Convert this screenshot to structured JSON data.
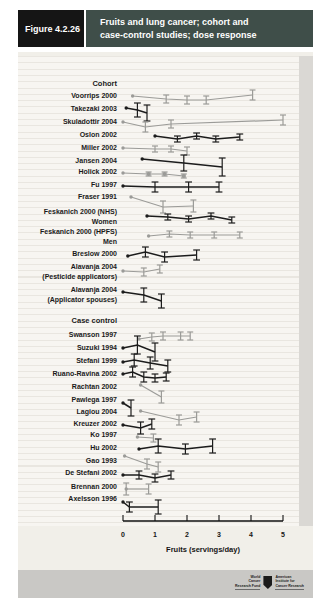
{
  "header": {
    "figure_label": "Figure 4.2.26",
    "title_line1": "Fruits and lung cancer; cohort and",
    "title_line2": "case-control studies; dose response"
  },
  "chart_data": {
    "type": "line",
    "title": "Fruits and lung cancer; cohort and case-control studies; dose response",
    "xlabel": "Fruits (servings/day)",
    "x_ticks": [
      0,
      1,
      2,
      3,
      4,
      5
    ],
    "xlim": [
      0,
      5
    ],
    "y_encoding": "each study is a dose-response polyline in its own row; dy = vertical pixel offset (relative risk, unlabeled scale); eb = confidence-interval half-height in px",
    "axis": {
      "x0": 123,
      "px_per_unit": 32,
      "axis_y": 521,
      "tick_len": 6
    },
    "colors": {
      "black": "#1c1c1c",
      "gray": "#9b9b98"
    },
    "groups": [
      {
        "label": "Cohort",
        "label_y": 84,
        "studies": [
          {
            "name": "Voorrips 2000",
            "label_y": 96,
            "line_y": 96,
            "color": "gray",
            "points": [
              {
                "x": 0.3,
                "dy": 0
              },
              {
                "x": 1.35,
                "dy": 3,
                "eb": 4
              },
              {
                "x": 2.0,
                "dy": 4,
                "eb": 4
              },
              {
                "x": 2.6,
                "dy": 4,
                "eb": 4
              },
              {
                "x": 4.05,
                "dy": -1,
                "eb": 5
              }
            ]
          },
          {
            "name": "Takezaki 2003",
            "label_y": 109,
            "line_y": 110,
            "color": "black",
            "points": [
              {
                "x": 0.1,
                "dy": -2
              },
              {
                "x": 0.45,
                "dy": 0,
                "eb": 7
              },
              {
                "x": 0.75,
                "dy": 3,
                "eb": 8
              }
            ]
          },
          {
            "name": "Skuladottir 2004",
            "label_y": 122,
            "line_y": 122,
            "color": "gray",
            "points": [
              {
                "x": 0.0,
                "dy": 0
              },
              {
                "x": 0.7,
                "dy": 5,
                "eb": 5
              },
              {
                "x": 1.5,
                "dy": 2,
                "eb": 4
              },
              {
                "x": 5.0,
                "dy": -2,
                "eb": 5
              }
            ]
          },
          {
            "name": "Oslon 2002",
            "label_y": 135,
            "line_y": 136,
            "color": "black",
            "points": [
              {
                "x": 1.0,
                "dy": 0
              },
              {
                "x": 1.7,
                "dy": 3,
                "eb": 3
              },
              {
                "x": 2.3,
                "dy": 0,
                "eb": 3
              },
              {
                "x": 2.9,
                "dy": 3,
                "eb": 3
              },
              {
                "x": 3.65,
                "dy": 1,
                "eb": 3
              }
            ]
          },
          {
            "name": "Miller 2002",
            "label_y": 148,
            "line_y": 148,
            "color": "gray",
            "points": [
              {
                "x": 0.0,
                "dy": 0
              },
              {
                "x": 1.0,
                "dy": 1,
                "eb": 3
              },
              {
                "x": 1.5,
                "dy": 1,
                "eb": 3
              },
              {
                "x": 2.0,
                "dy": 3,
                "eb": 4
              }
            ]
          },
          {
            "name": "Jansen 2004",
            "label_y": 161,
            "line_y": 162,
            "color": "black",
            "points": [
              {
                "x": 0.6,
                "dy": -3
              },
              {
                "x": 1.9,
                "dy": 1,
                "eb": 8
              },
              {
                "x": 3.1,
                "dy": 5,
                "eb": 9
              }
            ]
          },
          {
            "name": "Holick 2002",
            "label_y": 172,
            "line_y": 173,
            "color": "gray",
            "points": [
              {
                "x": 0.0,
                "dy": 0
              },
              {
                "x": 0.8,
                "dy": 1,
                "eb": 2,
                "sq": true
              },
              {
                "x": 1.3,
                "dy": 1,
                "eb": 2,
                "sq": true
              },
              {
                "x": 1.9,
                "dy": 3,
                "eb": 2,
                "sq": true
              }
            ]
          },
          {
            "name": "Fu 1997",
            "label_y": 185,
            "line_y": 186,
            "color": "black",
            "points": [
              {
                "x": 0.0,
                "dy": 0
              },
              {
                "x": 1.0,
                "dy": 1,
                "eb": 5
              },
              {
                "x": 2.05,
                "dy": 1,
                "eb": 5
              },
              {
                "x": 3.0,
                "dy": 1,
                "eb": 5
              }
            ]
          },
          {
            "name": "Fraser 1991",
            "label_y": 197,
            "line_y": 202,
            "color": "gray",
            "points": [
              {
                "x": 0.25,
                "dy": -5
              },
              {
                "x": 1.25,
                "dy": 5,
                "eb": 6
              },
              {
                "x": 2.2,
                "dy": 4,
                "eb": 6
              }
            ]
          },
          {
            "name": "Feskanich 2000 (NHS) Women",
            "label_lines": [
              "Feskanich 2000 (NHS)",
              "Women"
            ],
            "label_y": 217,
            "line_y": 216,
            "color": "black",
            "points": [
              {
                "x": 0.75,
                "dy": 0
              },
              {
                "x": 1.4,
                "dy": 1,
                "eb": 3
              },
              {
                "x": 2.05,
                "dy": 3,
                "eb": 3
              },
              {
                "x": 2.75,
                "dy": 0,
                "eb": 3
              },
              {
                "x": 3.4,
                "dy": 4,
                "eb": 3
              }
            ]
          },
          {
            "name": "Feskanich 2000 (HPFS) Men",
            "label_lines": [
              "Feskanich 2000 (HPFS)",
              "Men"
            ],
            "label_y": 237,
            "line_y": 236,
            "color": "gray",
            "points": [
              {
                "x": 0.8,
                "dy": 0
              },
              {
                "x": 1.45,
                "dy": -2,
                "eb": 3
              },
              {
                "x": 2.1,
                "dy": -1,
                "eb": 3
              },
              {
                "x": 2.85,
                "dy": -1,
                "eb": 3
              },
              {
                "x": 3.65,
                "dy": -1,
                "eb": 3
              }
            ]
          },
          {
            "name": "Breslow 2000",
            "label_y": 254,
            "line_y": 255,
            "color": "black",
            "points": [
              {
                "x": 0.15,
                "dy": 1
              },
              {
                "x": 0.7,
                "dy": -3,
                "eb": 5
              },
              {
                "x": 1.3,
                "dy": 2,
                "eb": 5
              },
              {
                "x": 2.3,
                "dy": 0,
                "eb": 5
              }
            ]
          },
          {
            "name": "Alavanja 2004 (Pesticide applicators)",
            "label_lines": [
              "Alavanja 2004",
              "(Pesticide applicators)"
            ],
            "label_y": 272,
            "line_y": 272,
            "color": "gray",
            "points": [
              {
                "x": 0.0,
                "dy": -1
              },
              {
                "x": 0.65,
                "dy": 0,
                "eb": 4
              },
              {
                "x": 1.15,
                "dy": -3,
                "eb": 4
              }
            ]
          },
          {
            "name": "Alavanja 2004 (Applicator spouses)",
            "label_lines": [
              "Alavanja 2004",
              "(Applicator spouses)"
            ],
            "label_y": 295,
            "line_y": 295,
            "color": "black",
            "points": [
              {
                "x": 0.0,
                "dy": -3
              },
              {
                "x": 0.65,
                "dy": 0,
                "eb": 7
              },
              {
                "x": 1.2,
                "dy": 6,
                "eb": 7
              }
            ]
          }
        ]
      },
      {
        "label": "Case control",
        "label_y": 321,
        "studies": [
          {
            "name": "Swanson 1997",
            "label_y": 335,
            "line_y": 337,
            "color": "gray",
            "points": [
              {
                "x": 0.5,
                "dy": 2
              },
              {
                "x": 0.9,
                "dy": 0,
                "eb": 4
              },
              {
                "x": 1.25,
                "dy": -1,
                "eb": 4
              },
              {
                "x": 1.8,
                "dy": -1,
                "eb": 4
              },
              {
                "x": 2.1,
                "dy": -1,
                "eb": 4
              }
            ]
          },
          {
            "name": "Suzuki 1994",
            "label_y": 348,
            "line_y": 350,
            "color": "black",
            "points": [
              {
                "x": 0.0,
                "dy": -2
              },
              {
                "x": 0.45,
                "dy": -5,
                "eb": 9
              },
              {
                "x": 1.0,
                "dy": 2,
                "eb": 9
              }
            ]
          },
          {
            "name": "Stefani 1999",
            "label_y": 361,
            "line_y": 362,
            "color": "black",
            "points": [
              {
                "x": 0.0,
                "dy": 0
              },
              {
                "x": 0.35,
                "dy": -2,
                "eb": 6
              },
              {
                "x": 0.85,
                "dy": 1,
                "eb": 6
              },
              {
                "x": 1.4,
                "dy": 4,
                "eb": 6
              }
            ]
          },
          {
            "name": "Ruano-Ravina 2002",
            "label_y": 374,
            "line_y": 375,
            "color": "black",
            "points": [
              {
                "x": 0.0,
                "dy": -1
              },
              {
                "x": 0.3,
                "dy": -3,
                "eb": 5
              },
              {
                "x": 0.65,
                "dy": 2,
                "eb": 5
              },
              {
                "x": 1.0,
                "dy": 3,
                "eb": 4
              },
              {
                "x": 1.35,
                "dy": 2,
                "eb": 4
              }
            ]
          },
          {
            "name": "Rachtan 2002",
            "label_y": 387,
            "line_y": 391,
            "color": "gray",
            "points": [
              {
                "x": 0.55,
                "dy": -6
              },
              {
                "x": 1.2,
                "dy": 6,
                "eb": 6
              }
            ]
          },
          {
            "name": "Pawlega 1997",
            "label_y": 400,
            "line_y": 405,
            "color": "black",
            "points": [
              {
                "x": 0.0,
                "dy": -2
              },
              {
                "x": 0.25,
                "dy": 3,
                "eb": 8
              }
            ]
          },
          {
            "name": "Lagiou 2004",
            "label_y": 412,
            "line_y": 416,
            "color": "gray",
            "points": [
              {
                "x": 0.55,
                "dy": -5
              },
              {
                "x": 1.75,
                "dy": 4,
                "eb": 5
              },
              {
                "x": 2.3,
                "dy": 1,
                "eb": 5
              }
            ]
          },
          {
            "name": "Kreuzer 2002",
            "label_y": 424,
            "line_y": 426,
            "color": "black",
            "points": [
              {
                "x": 0.0,
                "dy": -1
              },
              {
                "x": 0.55,
                "dy": 2,
                "eb": 6
              },
              {
                "x": 0.9,
                "dy": -2,
                "eb": 5
              }
            ]
          },
          {
            "name": "Ko 1997",
            "label_y": 435,
            "line_y": 437,
            "color": "gray",
            "points": [
              {
                "x": 0.45,
                "dy": 0
              },
              {
                "x": 0.95,
                "dy": 1,
                "eb": 4
              }
            ]
          },
          {
            "name": "Hu 2002",
            "label_y": 448,
            "line_y": 449,
            "color": "black",
            "points": [
              {
                "x": 0.5,
                "dy": 0
              },
              {
                "x": 1.1,
                "dy": -3,
                "eb": 7
              },
              {
                "x": 1.95,
                "dy": 0,
                "eb": 5
              },
              {
                "x": 2.8,
                "dy": -3,
                "eb": 7
              }
            ]
          },
          {
            "name": "Gao 1993",
            "label_y": 461,
            "line_y": 461,
            "color": "gray",
            "points": [
              {
                "x": 0.05,
                "dy": -5
              },
              {
                "x": 0.75,
                "dy": 3,
                "eb": 5
              },
              {
                "x": 1.1,
                "dy": 6,
                "eb": 5
              }
            ]
          },
          {
            "name": "De Stefani 2002",
            "label_y": 473,
            "line_y": 475,
            "color": "black",
            "points": [
              {
                "x": 0.0,
                "dy": 0
              },
              {
                "x": 0.5,
                "dy": 0,
                "eb": 4
              },
              {
                "x": 1.0,
                "dy": 3,
                "eb": 4
              },
              {
                "x": 1.5,
                "dy": 0,
                "eb": 4
              }
            ]
          },
          {
            "name": "Brennan 2000",
            "label_y": 487,
            "line_y": 489,
            "color": "gray",
            "points": [
              {
                "x": 0.1,
                "dy": 0,
                "eb": 6
              },
              {
                "x": 0.8,
                "dy": 0,
                "eb": 5
              }
            ]
          },
          {
            "name": "Axelsson 1996",
            "label_y": 499,
            "line_y": 505,
            "color": "black",
            "points": [
              {
                "x": 0.0,
                "dy": -3
              },
              {
                "x": 0.2,
                "dy": 2,
                "eb": 5
              },
              {
                "x": 1.1,
                "dy": 2,
                "eb": 7
              }
            ]
          }
        ]
      }
    ]
  },
  "footer": {
    "logo_left_lines": [
      "World",
      "Cancer",
      "Research Fund"
    ],
    "logo_right_lines": [
      "American",
      "Institute for",
      "Cancer Research"
    ]
  }
}
